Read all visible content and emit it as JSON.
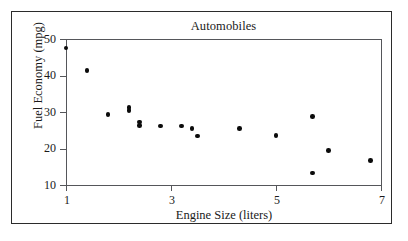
{
  "chart_data": {
    "type": "scatter",
    "title": "Automobiles",
    "xlabel": "Engine Size (liters)",
    "ylabel": "Fuel Economy (mpg)",
    "xlim": [
      1,
      7
    ],
    "ylim": [
      10,
      50
    ],
    "xticks": [
      1,
      3,
      5,
      7
    ],
    "xtick_labels": [
      "1",
      "3",
      "5",
      "7"
    ],
    "yticks": [
      10,
      20,
      30,
      40,
      50
    ],
    "ytick_labels": [
      "10",
      "20",
      "30",
      "40",
      "50"
    ],
    "grid": false,
    "legend": null,
    "marker": "filled-circle",
    "marker_color": "#0b0b0b",
    "points": [
      {
        "x": 1.0,
        "y": 47.5
      },
      {
        "x": 1.4,
        "y": 41.4
      },
      {
        "x": 1.8,
        "y": 29.3
      },
      {
        "x": 2.2,
        "y": 31.2
      },
      {
        "x": 2.2,
        "y": 30.4
      },
      {
        "x": 2.4,
        "y": 27.3
      },
      {
        "x": 2.4,
        "y": 26.3
      },
      {
        "x": 2.8,
        "y": 26.2
      },
      {
        "x": 3.2,
        "y": 26.2
      },
      {
        "x": 3.4,
        "y": 25.4
      },
      {
        "x": 3.5,
        "y": 23.4
      },
      {
        "x": 4.3,
        "y": 25.5
      },
      {
        "x": 5.0,
        "y": 23.5
      },
      {
        "x": 5.7,
        "y": 28.8
      },
      {
        "x": 5.7,
        "y": 13.3
      },
      {
        "x": 6.0,
        "y": 19.4
      },
      {
        "x": 6.8,
        "y": 16.7
      }
    ]
  },
  "figure": {
    "frame_color": "#2b2b2b",
    "axis_color": "#55565a",
    "background": "#ffffff"
  }
}
